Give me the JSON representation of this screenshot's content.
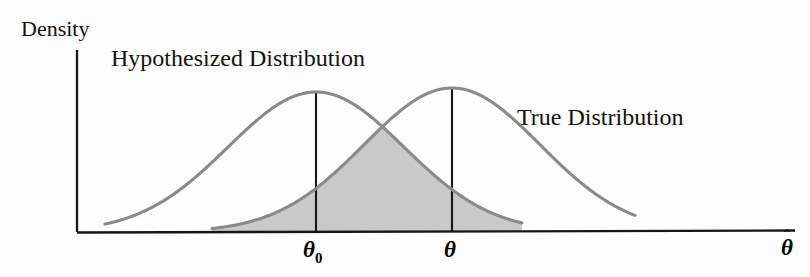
{
  "figure": {
    "kind": "statistical-density-diagram",
    "background_color": "#fdfdfd",
    "y_axis_label": "Density",
    "x_axis_label": "θ",
    "x_axis_label_accent": "ˆ",
    "curve_color": "#8a8a8a",
    "fill_color": "#c9c9c9",
    "axis_color": "#161616",
    "marker_line_color": "#161616"
  },
  "annotations": {
    "hypothesized_label": "Hypothesized Distribution",
    "true_label": "True Distribution"
  },
  "ticks": {
    "theta0_symbol": "θ",
    "theta0_subscript": "0",
    "theta_symbol": "θ"
  },
  "chart_data": {
    "type": "line",
    "title": "",
    "xlabel": "θ̂",
    "ylabel": "Density",
    "grid": false,
    "legend_position": "inline-annotations",
    "shaded_region": {
      "description": "Overlap (minimum) of the two density curves",
      "fill_color": "#c9c9c9",
      "x_start": 212,
      "x_end": 522
    },
    "vertical_markers": [
      {
        "label": "θ0",
        "x_px": 316,
        "top_px": 92,
        "bottom_px": 232
      },
      {
        "label": "θ",
        "x_px": 452,
        "top_px": 88,
        "bottom_px": 232
      }
    ],
    "axes_px": {
      "y_axis_x": 77,
      "y_axis_top": 50,
      "x_axis_y": 232,
      "x_axis_right": 795
    },
    "series": [
      {
        "name": "Hypothesized Distribution",
        "mean_px": 316,
        "peak_y_px": 92,
        "x_start_px": 105,
        "x_end_px": 522,
        "sigma_px": 88
      },
      {
        "name": "True Distribution",
        "mean_px": 452,
        "peak_y_px": 88,
        "x_start_px": 212,
        "x_end_px": 635,
        "sigma_px": 88
      }
    ],
    "crossing_point_px": {
      "x": 373,
      "y": 117
    }
  }
}
